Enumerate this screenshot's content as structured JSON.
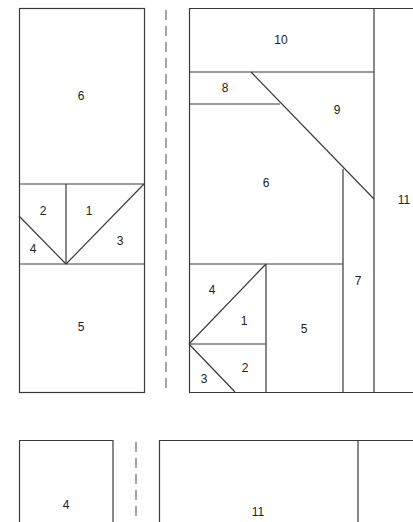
{
  "diagram": {
    "type": "cutting layout / piece plan",
    "left_panel": {
      "pieces": [
        {
          "label": "6",
          "x": 81,
          "y": 96
        },
        {
          "label": "2",
          "x": 43,
          "y": 211
        },
        {
          "label": "1",
          "x": 89,
          "y": 211
        },
        {
          "label": "3",
          "x": 120,
          "y": 241
        },
        {
          "label": "4",
          "x": 33,
          "y": 249
        },
        {
          "label": "5",
          "x": 81,
          "y": 327
        }
      ]
    },
    "right_panel": {
      "pieces": [
        {
          "label": "10",
          "x": 281,
          "y": 40
        },
        {
          "label": "8",
          "x": 225,
          "y": 88
        },
        {
          "label": "9",
          "x": 337,
          "y": 110
        },
        {
          "label": "6",
          "x": 266,
          "y": 183
        },
        {
          "label": "11",
          "x": 404,
          "y": 200
        },
        {
          "label": "7",
          "x": 358,
          "y": 281
        },
        {
          "label": "4",
          "x": 212,
          "y": 290
        },
        {
          "label": "1",
          "x": 244,
          "y": 321
        },
        {
          "label": "5",
          "x": 304,
          "y": 329
        },
        {
          "label": "2",
          "x": 245,
          "y": 368
        },
        {
          "label": "3",
          "x": 204,
          "y": 379
        }
      ]
    },
    "bottom_left": {
      "pieces": [
        {
          "label": "4",
          "x": 66,
          "y": 505
        }
      ]
    },
    "bottom_right": {
      "pieces": [
        {
          "label": "11",
          "x": 258,
          "y": 512
        }
      ]
    },
    "colors": {
      "line": "#3a3a3a",
      "dash": "#6a6a6a",
      "background": "#ffffff"
    }
  }
}
